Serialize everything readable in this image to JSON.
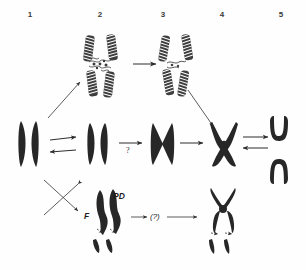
{
  "figure": {
    "background_color": "#fefefe",
    "ink_color": "#272727",
    "columns": [
      {
        "id": 1,
        "label": "1",
        "x": 30
      },
      {
        "id": 2,
        "label": "2",
        "x": 100
      },
      {
        "id": 3,
        "label": "3",
        "x": 163
      },
      {
        "id": 4,
        "label": "4",
        "x": 222
      },
      {
        "id": 5,
        "label": "5",
        "x": 281
      }
    ],
    "annotations": [
      {
        "name": "pd-label",
        "text": "PD",
        "x": 113,
        "y": 196
      },
      {
        "name": "f-label",
        "text": "F",
        "x": 84,
        "y": 216
      },
      {
        "name": "uncertainty-label",
        "text": "(?)",
        "x": 152,
        "y": 217
      },
      {
        "name": "question-mark-middle",
        "text": "?",
        "x": 127,
        "y": 152
      }
    ],
    "rows": [
      {
        "name": "top-row",
        "description": "Banded coiled chromosome pair at columns 2 and 3 joined by a horizontal arrow"
      },
      {
        "name": "middle-row",
        "description": "Solid chromatid stages across columns 1 to 5 with reversible double arrows"
      },
      {
        "name": "bottom-row",
        "description": "Wavy chromosome with PD and F labels transforming via (?) into a fragmented chromosome"
      }
    ]
  }
}
